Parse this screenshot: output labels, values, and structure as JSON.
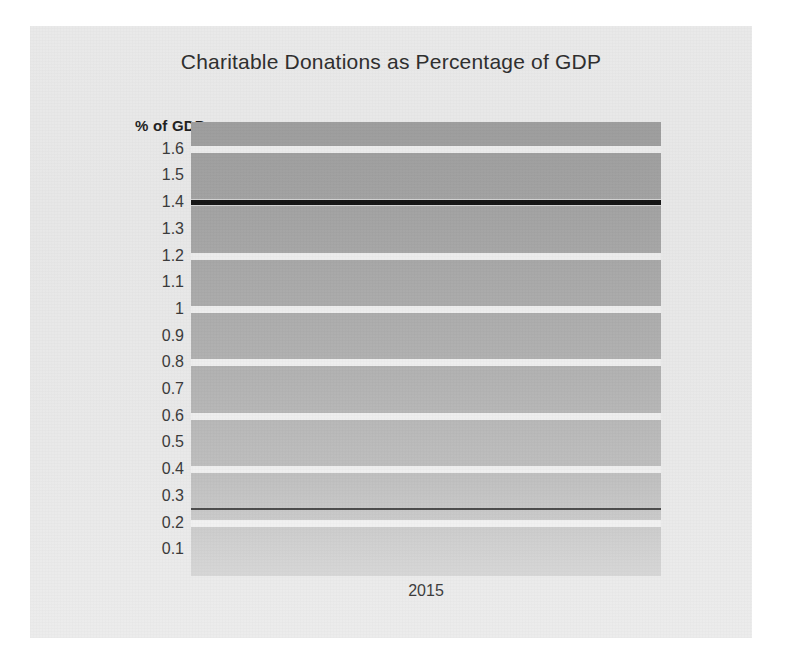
{
  "chart_data": {
    "type": "line",
    "title": "Charitable Donations as Percentage of GDP",
    "xlabel": "",
    "ylabel": "% of GDP",
    "categories": [
      "2015"
    ],
    "x": [
      "2015"
    ],
    "ylim": [
      0,
      1.7
    ],
    "y_ticks": [
      "1.6",
      "1.5",
      "1.4",
      "1.3",
      "1.2",
      "1.1",
      "1",
      "0.9",
      "0.8",
      "0.7",
      "0.6",
      "0.5",
      "0.4",
      "0.3",
      "0.2",
      "0.1"
    ],
    "y_tick_values": [
      1.6,
      1.5,
      1.4,
      1.3,
      1.2,
      1.1,
      1.0,
      0.9,
      0.8,
      0.7,
      0.6,
      0.5,
      0.4,
      0.3,
      0.2,
      0.1
    ],
    "x_tick_labels": [
      "2015"
    ],
    "grid": true,
    "grid_interval": 0.2,
    "legend": false,
    "legend_position": "none",
    "series": [
      {
        "name": "series-1",
        "values": [
          1.4
        ],
        "level": 1.4,
        "color": "#141414",
        "width": 5
      },
      {
        "name": "series-2",
        "values": [
          0.25
        ],
        "level": 0.25,
        "color": "#4d4d4d",
        "width": 2
      }
    ],
    "annotations": []
  },
  "chart": {
    "title": "Charitable Donations as Percentage of GDP",
    "y_axis_title": "% of GDP",
    "x_axis_label": "2015"
  },
  "page": {
    "footer_artifact": ""
  }
}
